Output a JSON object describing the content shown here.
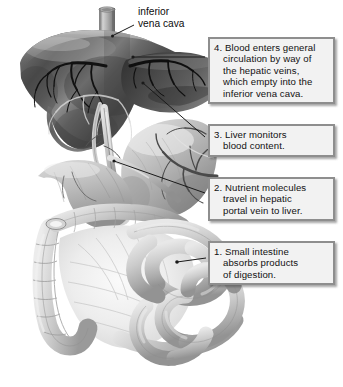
{
  "figure": {
    "background_color": "#ffffff",
    "width": 343,
    "height": 387
  },
  "labels": {
    "inferior_vena_cava": {
      "line1": "inferior",
      "line2": "vena cava"
    }
  },
  "callouts": [
    {
      "id": "step-4",
      "number": "4.",
      "lines": [
        "4. Blood enters general",
        "circulation by way of",
        "the hepatic veins,",
        "which empty into the",
        "inferior vena cava."
      ]
    },
    {
      "id": "step-3",
      "number": "3.",
      "lines": [
        "3. Liver monitors",
        "blood content."
      ]
    },
    {
      "id": "step-2",
      "number": "2.",
      "lines": [
        "2. Nutrient molecules",
        "travel in hepatic",
        "portal vein to liver."
      ]
    },
    {
      "id": "step-1",
      "number": "1.",
      "lines": [
        "1. Small intestine",
        "absorbs products",
        "of digestion."
      ]
    }
  ],
  "anatomy": {
    "organs": [
      "liver",
      "inferior vena cava",
      "stomach",
      "duodenum",
      "small intestine",
      "large intestine",
      "hepatic portal vein",
      "mesentery"
    ]
  },
  "colors": {
    "box_fill": "#f2f2f2",
    "box_border": "#8e8e8e",
    "text": "#111111",
    "leader_line": "#1a1a1a",
    "liver_dark": "#4a4a4a",
    "liver_mid": "#6e6e6e",
    "liver_light": "#9c9c9c",
    "organ_light": "#c9c9c9",
    "organ_mid": "#a8a8a8",
    "vessel": "#141414",
    "background": "#ffffff"
  }
}
